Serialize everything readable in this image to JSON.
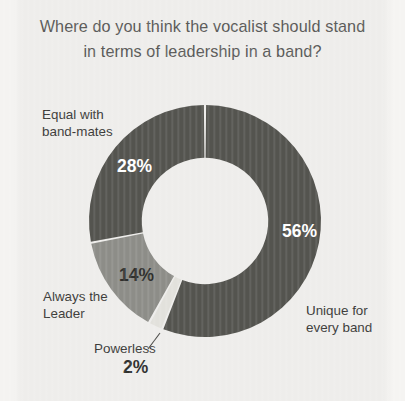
{
  "title": "Where do you think the vocalist should stand\nin terms of leadership in a band?",
  "colors": {
    "background": "#eeedeb",
    "title_text": "#5a5a58",
    "label_text": "#3b3b39",
    "segment_dark": "#54544f",
    "segment_medium": "#8d8d88",
    "segment_light": "#e2e1dc",
    "segment_gap": "#f4f3f1"
  },
  "labels": {
    "equal": "Equal with\nband-mates",
    "always": "Always the\nLeader",
    "powerless": "Powerless",
    "unique": "Unique for\nevery band"
  },
  "values": {
    "unique": "56%",
    "equal": "28%",
    "always": "14%",
    "powerless": "2%"
  },
  "chart_data": {
    "type": "pie",
    "variant": "donut",
    "title": "Where do you think the vocalist should stand in terms of leadership in a band?",
    "start_angle_deg": 0,
    "direction": "clockwise",
    "hole_ratio": 0.545,
    "categories": [
      "Unique for every band",
      "Powerless",
      "Always the Leader",
      "Equal with band-mates"
    ],
    "values": [
      56,
      2,
      14,
      28
    ],
    "value_labels": [
      "56%",
      "2%",
      "14%",
      "28%"
    ],
    "colors": [
      "#54544f",
      "#e2e1dc",
      "#8d8d88",
      "#54544f"
    ],
    "units": "percent",
    "total": 100,
    "legend": "none",
    "grid": false,
    "leader_lines": [
      "Powerless"
    ]
  }
}
